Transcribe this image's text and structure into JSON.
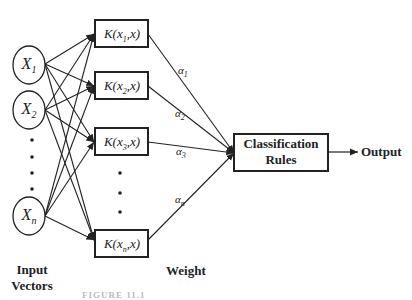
{
  "inputs": [
    {
      "label": "X",
      "sub": "1"
    },
    {
      "label": "X",
      "sub": "2"
    },
    {
      "label": "X",
      "sub": "n"
    }
  ],
  "kernels": [
    {
      "label": "K(x",
      "sub": "1",
      "tail": ",x)"
    },
    {
      "label": "K(x",
      "sub": "2",
      "tail": ",x)"
    },
    {
      "label": "K(x",
      "sub": "3",
      "tail": ",x)"
    },
    {
      "label": "K(x",
      "sub": "n",
      "tail": ",x)"
    }
  ],
  "weights": [
    {
      "label": "α",
      "sub": "1"
    },
    {
      "label": "α",
      "sub": "2"
    },
    {
      "label": "α",
      "sub": "3"
    },
    {
      "label": "α",
      "sub": "n"
    }
  ],
  "classifier": {
    "line1": "Classification",
    "line2": "Rules"
  },
  "output_label": "Output",
  "input_caption": {
    "line1": "Input",
    "line2": "Vectors"
  },
  "weight_caption": "Weight",
  "figure_caption": "FIGURE 11.1"
}
